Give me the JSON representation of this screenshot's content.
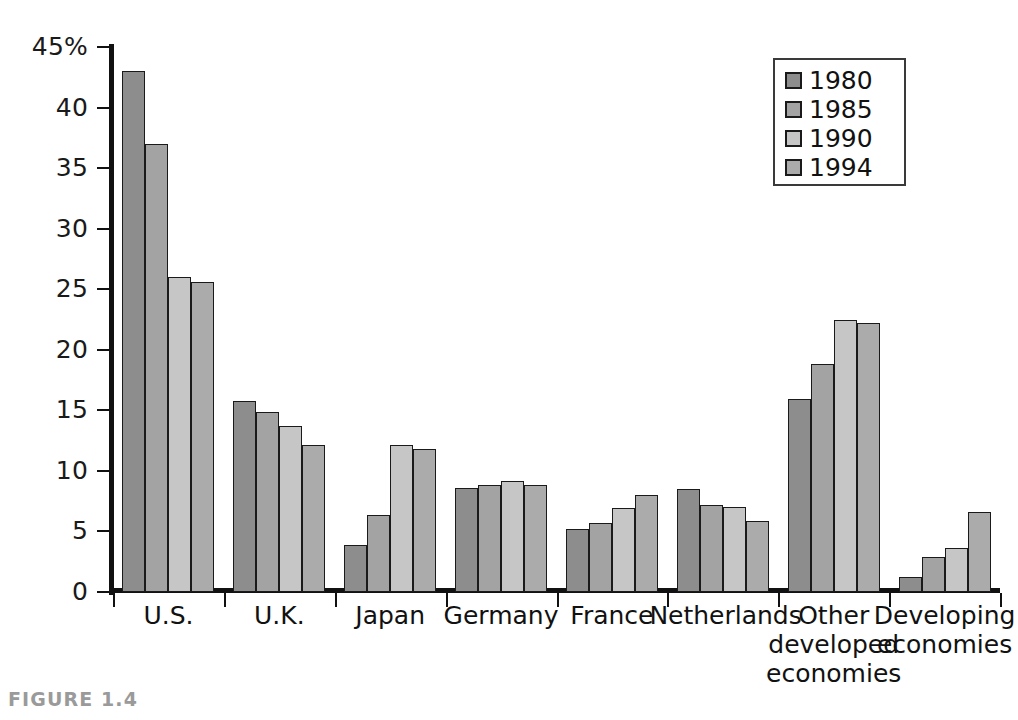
{
  "figure": {
    "caption": "FIGURE 1.4"
  },
  "legend": {
    "position": "top-right",
    "entries": [
      {
        "label": "1980",
        "color": "#8d8d8d"
      },
      {
        "label": "1985",
        "color": "#a3a3a3"
      },
      {
        "label": "1990",
        "color": "#c6c6c6"
      },
      {
        "label": "1994",
        "color": "#ababab"
      }
    ]
  },
  "chart_data": {
    "type": "bar",
    "title": "",
    "xlabel": "",
    "ylabel": "",
    "ylim": [
      0,
      45
    ],
    "grid": false,
    "legend_position": "top-right",
    "y_ticks": [
      "0",
      "5",
      "10",
      "15",
      "20",
      "25",
      "30",
      "35",
      "40",
      "45%"
    ],
    "y_tick_values": [
      0,
      5,
      10,
      15,
      20,
      25,
      30,
      35,
      40,
      45
    ],
    "categories": [
      "U.S.",
      "U.K.",
      "Japan",
      "Germany",
      "France",
      "Netherlands",
      "Other\ndeveloped\neconomies",
      "Developing\neconomies"
    ],
    "series": [
      {
        "name": "1980",
        "color": "#8d8d8d",
        "values": [
          43.0,
          15.8,
          3.9,
          8.6,
          5.2,
          8.5,
          15.9,
          1.2
        ]
      },
      {
        "name": "1985",
        "color": "#a3a3a3",
        "values": [
          37.0,
          14.9,
          6.4,
          8.8,
          5.7,
          7.2,
          18.8,
          2.9
        ]
      },
      {
        "name": "1990",
        "color": "#c6c6c6",
        "values": [
          26.0,
          13.7,
          12.1,
          9.2,
          6.9,
          7.0,
          22.5,
          3.6
        ]
      },
      {
        "name": "1994",
        "color": "#ababab",
        "values": [
          25.6,
          12.1,
          11.8,
          8.8,
          8.0,
          5.9,
          22.2,
          6.6
        ]
      }
    ]
  }
}
